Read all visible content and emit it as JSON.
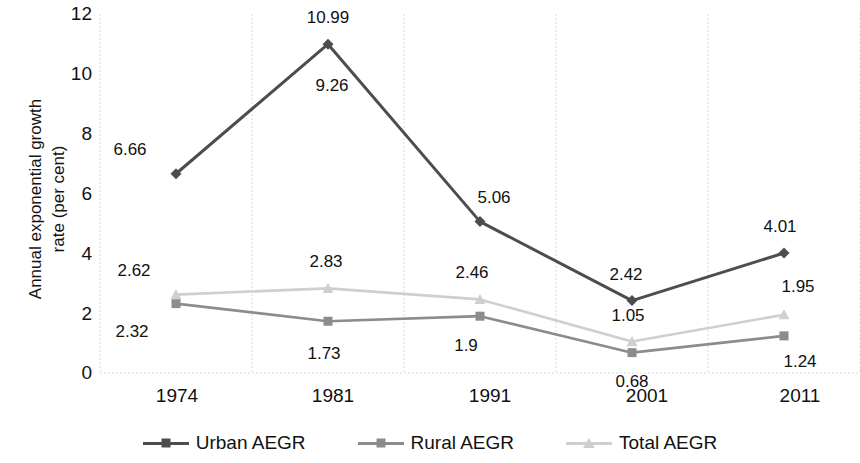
{
  "chart_data": {
    "type": "line",
    "title": "",
    "xlabel": "",
    "ylabel": "Annual exponential growth\nrate (per cent)",
    "categories": [
      "1974",
      "1981",
      "1991",
      "2001",
      "2011"
    ],
    "ylim": [
      0,
      12
    ],
    "yticks": [
      "0",
      "2",
      "4",
      "6",
      "8",
      "10",
      "12"
    ],
    "grid": "vertical-category-dashed",
    "legend_position": "bottom-center",
    "series": [
      {
        "name": "Urban AEGR",
        "color": "#4d4d4d",
        "marker": "diamond",
        "values": [
          6.66,
          10.99,
          5.06,
          2.42,
          4.01
        ],
        "labels": [
          "6.66",
          "10.99",
          "5.06",
          "2.42",
          "4.01"
        ]
      },
      {
        "name": "Rural AEGR",
        "color": "#8c8c8c",
        "marker": "square",
        "values": [
          2.32,
          1.73,
          1.9,
          0.68,
          1.24
        ],
        "labels": [
          "2.32",
          "1.73",
          "1.9",
          "0.68",
          "1.24"
        ]
      },
      {
        "name": "Total AEGR",
        "color": "#cfcfcf",
        "marker": "triangle",
        "values": [
          2.62,
          2.83,
          2.46,
          1.05,
          1.95
        ],
        "labels": [
          "2.62",
          "2.83",
          "2.46",
          "1.05",
          "1.95"
        ]
      }
    ],
    "extra_labels": [
      {
        "text": "9.26",
        "note": "urban-1981-secondary-label"
      }
    ]
  },
  "axis": {
    "y_title": "Annual exponential growth\nrate (per cent)",
    "y_tick_12": "12",
    "y_tick_10": "10",
    "y_tick_8": "8",
    "y_tick_6": "6",
    "y_tick_4": "4",
    "y_tick_2": "2",
    "y_tick_0": "0",
    "x_tick_0": "1974",
    "x_tick_1": "1981",
    "x_tick_2": "1991",
    "x_tick_3": "2001",
    "x_tick_4": "2011"
  },
  "labels": {
    "urban": [
      "6.66",
      "10.99",
      "5.06",
      "2.42",
      "4.01"
    ],
    "urban_extra": "9.26",
    "rural": [
      "2.32",
      "1.73",
      "1.9",
      "0.68",
      "1.24"
    ],
    "total": [
      "2.62",
      "2.83",
      "2.46",
      "1.05",
      "1.95"
    ]
  },
  "legend": {
    "items": [
      {
        "label": "Urban AEGR",
        "color": "#4d4d4d",
        "marker": "diamond"
      },
      {
        "label": "Rural AEGR",
        "color": "#8c8c8c",
        "marker": "square"
      },
      {
        "label": "Total AEGR",
        "color": "#cfcfcf",
        "marker": "triangle"
      }
    ]
  },
  "colors": {
    "urban": "#4d4d4d",
    "rural": "#8c8c8c",
    "total": "#cfcfcf",
    "grid": "#d9d9d9",
    "text": "#111111",
    "background": "#ffffff"
  }
}
